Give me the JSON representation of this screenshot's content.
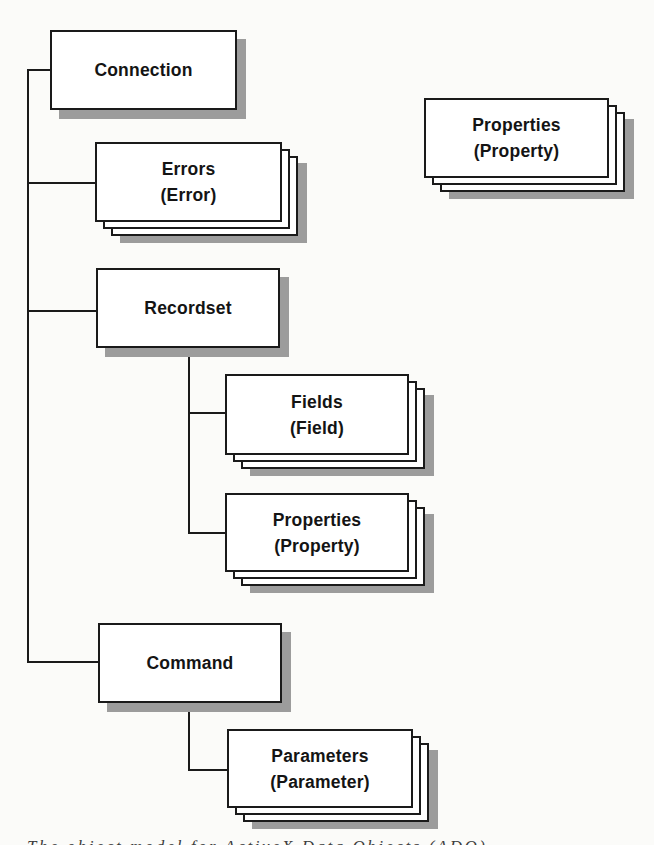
{
  "diagram": {
    "nodes": [
      {
        "id": "connection",
        "label": "Connection",
        "sublabel": "",
        "type": "single"
      },
      {
        "id": "errors",
        "label": "Errors",
        "sublabel": "(Error)",
        "type": "stack"
      },
      {
        "id": "properties-floating",
        "label": "Properties",
        "sublabel": "(Property)",
        "type": "stack"
      },
      {
        "id": "recordset",
        "label": "Recordset",
        "sublabel": "",
        "type": "single"
      },
      {
        "id": "fields",
        "label": "Fields",
        "sublabel": "(Field)",
        "type": "stack"
      },
      {
        "id": "properties-recordset",
        "label": "Properties",
        "sublabel": "(Property)",
        "type": "stack"
      },
      {
        "id": "command",
        "label": "Command",
        "sublabel": "",
        "type": "single"
      },
      {
        "id": "parameters",
        "label": "Parameters",
        "sublabel": "(Parameter)",
        "type": "stack"
      }
    ],
    "edges": [
      [
        "connection",
        "errors"
      ],
      [
        "connection",
        "recordset"
      ],
      [
        "connection",
        "command"
      ],
      [
        "recordset",
        "fields"
      ],
      [
        "recordset",
        "properties-recordset"
      ],
      [
        "command",
        "parameters"
      ]
    ],
    "caption": {
      "text": "The object model for ActiveX Data Objects (ADO)",
      "clipped": true,
      "visible_fragment": "(ADO)"
    }
  },
  "colors": {
    "background": "#fbfbf9",
    "box_fill": "#ffffff",
    "border": "#1a1a1a",
    "shadow": "#9c9c9c",
    "text": "#141414"
  }
}
